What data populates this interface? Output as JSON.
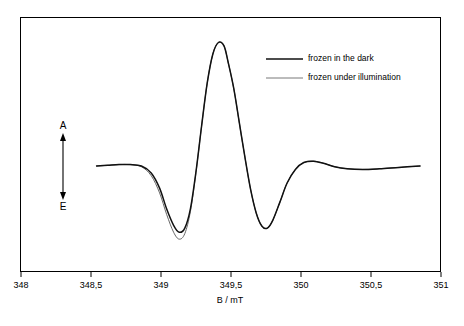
{
  "chart_data": {
    "type": "line",
    "title": "",
    "xlabel": "B  /  mT",
    "ylabel": "",
    "xlim": [
      348,
      351
    ],
    "ylim": [
      -1.25,
      1.9
    ],
    "grid": false,
    "legend_position": "top-right",
    "xticks": [
      "348",
      "348,5",
      "349",
      "349,5",
      "350",
      "350,5",
      "351"
    ],
    "xtick_values": [
      348,
      348.5,
      349,
      349.5,
      350,
      350.5,
      351
    ],
    "annotations": [
      {
        "name": "absorption",
        "text": "A"
      },
      {
        "name": "emission",
        "text": "E"
      }
    ],
    "series": [
      {
        "name": "frozen in the dark",
        "style": "thick",
        "color": "#111111",
        "x": [
          348.54,
          348.62,
          348.7,
          348.78,
          348.86,
          348.93,
          348.99,
          349.04,
          349.09,
          349.13,
          349.17,
          349.21,
          349.25,
          349.29,
          349.33,
          349.37,
          349.41,
          349.45,
          349.48,
          349.52,
          349.56,
          349.6,
          349.64,
          349.68,
          349.72,
          349.76,
          349.8,
          349.85,
          349.9,
          349.96,
          350.02,
          350.09,
          350.16,
          350.24,
          350.33,
          350.44,
          350.56,
          350.7,
          350.85
        ],
        "y": [
          0.0,
          0.01,
          0.02,
          0.02,
          0.0,
          -0.1,
          -0.32,
          -0.62,
          -0.86,
          -0.96,
          -0.9,
          -0.62,
          -0.08,
          0.58,
          1.2,
          1.62,
          1.79,
          1.74,
          1.5,
          1.12,
          0.62,
          0.12,
          -0.34,
          -0.68,
          -0.87,
          -0.9,
          -0.78,
          -0.52,
          -0.25,
          -0.05,
          0.05,
          0.07,
          0.04,
          -0.01,
          -0.04,
          -0.05,
          -0.04,
          -0.02,
          0.0
        ]
      },
      {
        "name": "frozen under illumination",
        "style": "thin",
        "color": "#555555",
        "x": [
          348.54,
          348.62,
          348.7,
          348.78,
          348.86,
          348.93,
          348.99,
          349.04,
          349.09,
          349.13,
          349.17,
          349.21,
          349.25,
          349.29,
          349.33,
          349.37,
          349.41,
          349.45,
          349.48,
          349.52,
          349.56,
          349.6,
          349.64,
          349.68,
          349.72,
          349.76,
          349.8,
          349.85,
          349.9,
          349.96,
          350.02,
          350.09,
          350.16,
          350.24,
          350.33,
          350.44,
          350.56,
          350.7,
          350.85
        ],
        "y": [
          0.0,
          0.01,
          0.02,
          0.02,
          -0.01,
          -0.14,
          -0.39,
          -0.7,
          -0.96,
          -1.06,
          -0.98,
          -0.66,
          -0.09,
          0.58,
          1.2,
          1.62,
          1.79,
          1.74,
          1.5,
          1.12,
          0.62,
          0.12,
          -0.34,
          -0.68,
          -0.87,
          -0.9,
          -0.78,
          -0.52,
          -0.25,
          -0.05,
          0.05,
          0.07,
          0.04,
          -0.01,
          -0.04,
          -0.05,
          -0.04,
          -0.02,
          0.0
        ]
      }
    ]
  }
}
